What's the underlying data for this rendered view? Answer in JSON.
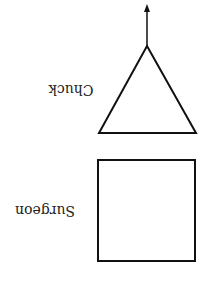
{
  "diagram": {
    "orientation": "rotated-180",
    "nodes": [
      {
        "id": "triangle",
        "shape": "triangle",
        "label": "Chuck"
      },
      {
        "id": "square",
        "shape": "square",
        "label": "Surgeon"
      }
    ],
    "edges": [
      {
        "from": "triangle",
        "direction": "arrow-out-from-apex"
      }
    ],
    "colors": {
      "stroke": "#111111",
      "background": "#ffffff",
      "text": "#222222"
    }
  }
}
